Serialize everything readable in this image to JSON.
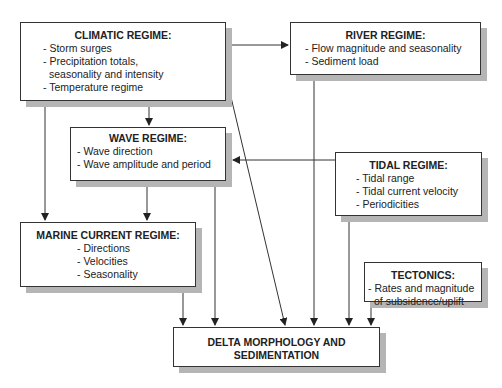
{
  "diagram": {
    "nodes": {
      "climatic": {
        "title": "CLIMATIC REGIME:",
        "items": [
          "- Storm surges",
          "- Precipitation totals,",
          "  seasonality and intensity",
          "- Temperature regime"
        ]
      },
      "river": {
        "title": "RIVER REGIME:",
        "items": [
          "- Flow magnitude and seasonality",
          "- Sediment load"
        ]
      },
      "wave": {
        "title": "WAVE REGIME:",
        "items": [
          "- Wave direction",
          "- Wave amplitude and period"
        ]
      },
      "tidal": {
        "title": "TIDAL REGIME:",
        "items": [
          "- Tidal range",
          "- Tidal current velocity",
          "- Periodicities"
        ]
      },
      "marine": {
        "title": "MARINE CURRENT REGIME:",
        "items": [
          "- Directions",
          "- Velocities",
          "- Seasonality"
        ]
      },
      "tectonics": {
        "title": "TECTONICS:",
        "items": [
          "- Rates and magnitude",
          "  of subsidence/uplift"
        ]
      },
      "delta": {
        "title_line1": "DELTA MORPHOLOGY AND",
        "title_line2": "SEDIMENTATION"
      }
    },
    "edges": [
      {
        "from": "climatic",
        "to": "river"
      },
      {
        "from": "climatic",
        "to": "wave"
      },
      {
        "from": "climatic",
        "to": "marine"
      },
      {
        "from": "climatic",
        "to": "delta"
      },
      {
        "from": "river",
        "to": "delta"
      },
      {
        "from": "wave",
        "to": "marine"
      },
      {
        "from": "wave",
        "to": "delta"
      },
      {
        "from": "tidal",
        "to": "wave"
      },
      {
        "from": "tidal",
        "to": "delta"
      },
      {
        "from": "marine",
        "to": "delta"
      },
      {
        "from": "tectonics",
        "to": "delta"
      }
    ],
    "colors": {
      "line": "#333333",
      "shadow": "#b5b5b5",
      "box_bg": "#ffffff"
    }
  }
}
